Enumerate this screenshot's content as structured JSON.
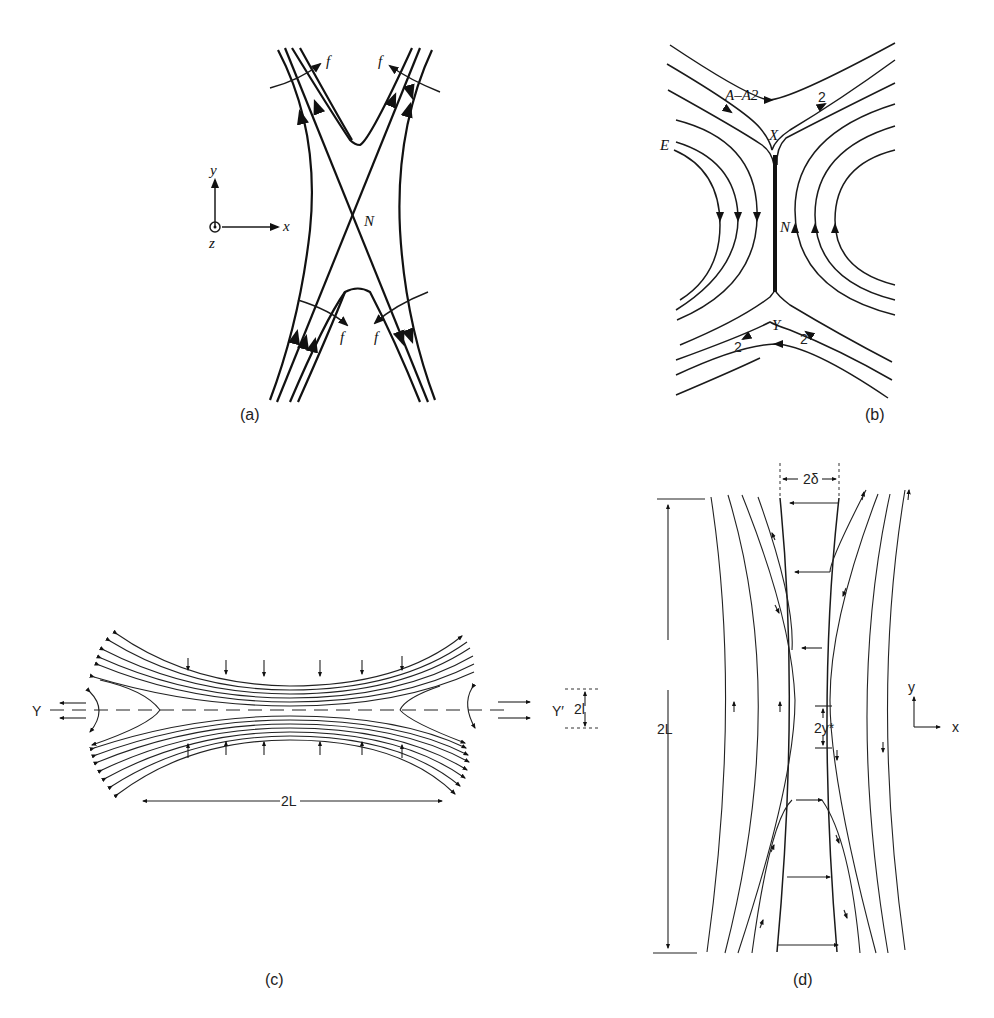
{
  "figure": {
    "panels": [
      {
        "id": "a",
        "caption": "(a)",
        "labels": {
          "null_point": "N",
          "flux": "f",
          "axis_x": "x",
          "axis_y": "y",
          "axis_z": "z"
        }
      },
      {
        "id": "b",
        "caption": "(b)",
        "labels": {
          "x_point": "X",
          "y_point": "Y",
          "null_line": "N",
          "electric": "E",
          "potential": "A–A2",
          "field_value": "2"
        }
      },
      {
        "id": "c",
        "caption": "(c)",
        "labels": {
          "left": "Y",
          "right": "Y′",
          "thickness": "2l",
          "length": "2L"
        }
      },
      {
        "id": "d",
        "caption": "(d)",
        "labels": {
          "width": "2δ",
          "length": "2L",
          "separation": "2y*",
          "axis_x": "x",
          "axis_y": "y"
        }
      }
    ]
  }
}
